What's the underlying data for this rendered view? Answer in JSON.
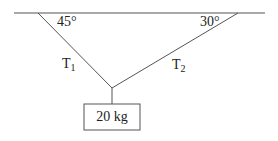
{
  "diagram": {
    "type": "statics-free-body",
    "ceiling": {
      "x1": 14,
      "y1": 13,
      "x2": 265,
      "y2": 13
    },
    "ropes": [
      {
        "id": "T1",
        "label_main": "T",
        "label_sub": "1",
        "x1": 38,
        "y1": 13,
        "x2": 112,
        "y2": 88
      },
      {
        "id": "T2",
        "label_main": "T",
        "label_sub": "2",
        "x1": 238,
        "y1": 13,
        "x2": 112,
        "y2": 88
      }
    ],
    "angles": [
      {
        "label": "45°",
        "at": "left-ceiling"
      },
      {
        "label": "30°",
        "at": "right-ceiling"
      }
    ],
    "hanger": {
      "x1": 112,
      "y1": 88,
      "x2": 112,
      "y2": 104
    },
    "mass": {
      "label": "20 kg",
      "x": 84,
      "y": 104,
      "width": 56,
      "height": 26
    },
    "colors": {
      "stroke": "#555555",
      "text": "#222222",
      "background": "#ffffff"
    }
  }
}
